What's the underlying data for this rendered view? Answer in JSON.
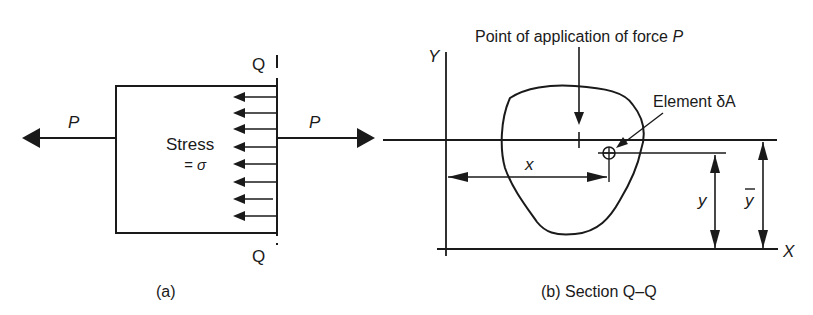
{
  "figure_a": {
    "force_left_label": "P",
    "force_right_label": "P",
    "stress_label": "Stress",
    "stress_value": "= σ",
    "section_top_label": "Q",
    "section_bottom_label": "Q",
    "caption": "(a)"
  },
  "figure_b": {
    "force_point_label": "Point of application of force",
    "force_point_symbol": "P",
    "element_label": "Element δA",
    "y_axis_label": "Y",
    "x_axis_label": "X",
    "x_dim_label": "x",
    "y_dim_label": "y",
    "ybar_dim_label": "y",
    "caption": "(b) Section Q–Q"
  },
  "colors": {
    "ink": "#1a1a1a",
    "background": "#ffffff"
  }
}
